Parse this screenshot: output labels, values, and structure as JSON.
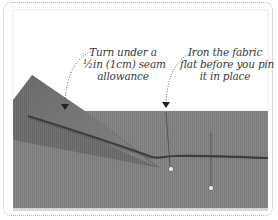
{
  "figure": {
    "colors": {
      "fabric": "#858585",
      "fabric_dark": "#5e5e5e",
      "fold_shadow": "#3d3d3d",
      "border": "#b9b9b9",
      "text": "#3a3a3a"
    },
    "annotations": [
      {
        "id": "turn-under",
        "lines": [
          "Turn under a",
          "½in (1cm) seam",
          "allowance"
        ]
      },
      {
        "id": "iron-flat",
        "lines": [
          "Iron the fabric",
          "flat before you pin",
          "it in place"
        ]
      }
    ]
  }
}
